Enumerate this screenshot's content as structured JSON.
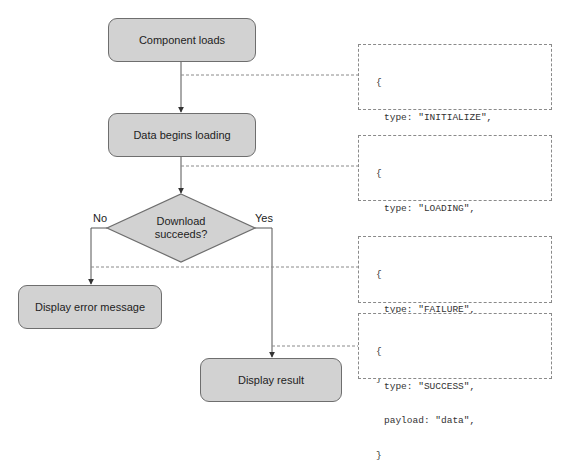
{
  "diagram": {
    "nodes": {
      "component_loads": "Component loads",
      "data_begins_loading": "Data begins loading",
      "decision": {
        "line1": "Download",
        "line2": "succeeds?"
      },
      "display_error": "Display error message",
      "display_result": "Display result"
    },
    "branches": {
      "no": "No",
      "yes": "Yes"
    },
    "actions": [
      {
        "open": "{",
        "lines": [
          "type: \"INITIALIZE\","
        ],
        "close": "}"
      },
      {
        "open": "{",
        "lines": [
          "type: \"LOADING\","
        ],
        "close": "}"
      },
      {
        "open": "{",
        "lines": [
          "type: \"FAILURE\",",
          "payload: \"404\","
        ],
        "close": "}"
      },
      {
        "open": "{",
        "lines": [
          "type: \"SUCCESS\",",
          "payload: \"data\","
        ],
        "close": "}"
      }
    ],
    "colors": {
      "node_fill": "#d2d2d2",
      "node_stroke": "#6e6e6e",
      "connector": "#555555",
      "dashed": "#8a8a8a"
    }
  }
}
